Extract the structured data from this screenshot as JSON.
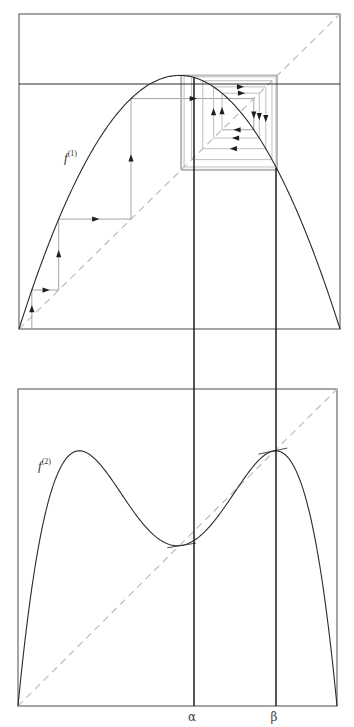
{
  "figure": {
    "type": "cobweb-diagram-logistic-map",
    "width": 354,
    "height": 727
  },
  "top_panel": {
    "box": {
      "x0": 19,
      "y0": 14,
      "x1": 340,
      "y1": 329
    },
    "function_label": "f",
    "function_superscript": "(1)",
    "label_pos": {
      "x": 64,
      "y": 162
    },
    "parameter_r": 3.22,
    "horizontal_line_value": 0.778,
    "cobweb_start_x": 0.04,
    "cobweb_iterations": 40
  },
  "bottom_panel": {
    "box": {
      "x0": 18,
      "y0": 389,
      "x1": 337,
      "y1": 706
    },
    "function_label": "f",
    "function_superscript": "(2)",
    "label_pos": {
      "x": 38,
      "y": 470
    }
  },
  "markers": {
    "alpha": {
      "label": "α",
      "x": 194,
      "value": 0.513
    },
    "beta": {
      "label": "β",
      "x": 276,
      "value": 0.799
    }
  },
  "colors": {
    "curve": "#2a2a2a",
    "box": "#6a6a6a",
    "diagonal": "#bdbdbd",
    "cobweb": "#9a9a9a",
    "marker_lines": "#1e1e1e"
  }
}
